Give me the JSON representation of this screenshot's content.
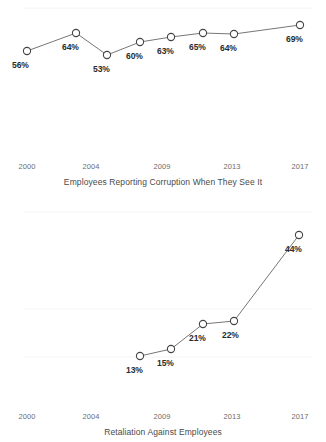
{
  "chart_data": [
    {
      "type": "line",
      "title": "Employees Reporting Corruption When They See It",
      "xlabel": "",
      "ylabel": "",
      "grid": true,
      "legend": "none",
      "x_ticks": [
        "2000",
        "2004",
        "2009",
        "2013",
        "2017"
      ],
      "x_tick_positions": [
        27,
        91,
        162,
        232,
        300
      ],
      "categories": [
        2000,
        2004,
        2006,
        2009,
        2011,
        2013,
        2015,
        2017
      ],
      "values": [
        56,
        64,
        53,
        60,
        63,
        65,
        64,
        69
      ],
      "point_labels": [
        "56%",
        "64%",
        "53%",
        "60%",
        "63%",
        "65%",
        "64%",
        "69%"
      ],
      "points": [
        {
          "label": "56%",
          "value": 56,
          "cx": 27,
          "cy": 51,
          "lx": 12,
          "ly": 60
        },
        {
          "label": "64%",
          "value": 64,
          "cx": 76,
          "cy": 33,
          "lx": 62,
          "ly": 42
        },
        {
          "label": "53%",
          "value": 53,
          "cx": 107,
          "cy": 55,
          "lx": 93,
          "ly": 64
        },
        {
          "label": "60%",
          "value": 60,
          "cx": 140,
          "cy": 42,
          "lx": 126,
          "ly": 51
        },
        {
          "label": "63%",
          "value": 63,
          "cx": 171,
          "cy": 37,
          "lx": 157,
          "ly": 46
        },
        {
          "label": "65%",
          "value": 65,
          "cx": 203,
          "cy": 33,
          "lx": 189,
          "ly": 42
        },
        {
          "label": "64%",
          "value": 64,
          "cx": 234,
          "cy": 34,
          "lx": 220,
          "ly": 43
        },
        {
          "label": "69%",
          "value": 69,
          "cx": 300,
          "cy": 25,
          "lx": 286,
          "ly": 34
        }
      ],
      "gridlines_y": [
        8
      ]
    },
    {
      "type": "line",
      "title": "Retaliation Against Employees",
      "xlabel": "",
      "ylabel": "",
      "grid": true,
      "legend": "none",
      "x_ticks": [
        "2000",
        "2004",
        "2009",
        "2013",
        "2017"
      ],
      "x_tick_positions": [
        27,
        91,
        162,
        232,
        300
      ],
      "categories": [
        2009,
        2011,
        2013,
        2015,
        2017
      ],
      "values": [
        13,
        15,
        21,
        22,
        44
      ],
      "point_labels": [
        "13%",
        "15%",
        "21%",
        "22%",
        "44%"
      ],
      "points": [
        {
          "label": "13%",
          "value": 13,
          "cx": 140,
          "cy": 166,
          "lx": 126,
          "ly": 175
        },
        {
          "label": "15%",
          "value": 15,
          "cx": 171,
          "cy": 159,
          "lx": 157,
          "ly": 168
        },
        {
          "label": "21%",
          "value": 21,
          "cx": 203,
          "cy": 134,
          "lx": 189,
          "ly": 143
        },
        {
          "label": "22%",
          "value": 22,
          "cx": 234,
          "cy": 131,
          "lx": 222,
          "ly": 140
        },
        {
          "label": "44%",
          "value": 44,
          "cx": 299,
          "cy": 45,
          "lx": 285,
          "ly": 54
        }
      ],
      "gridlines_y": [
        22,
        119,
        167
      ]
    }
  ],
  "colors": {
    "line": "#666666",
    "marker_stroke": "#444444",
    "marker_fill": "#ffffff",
    "grid": "#f1f1f1",
    "label_text": "#2b2b2b",
    "tick_text": "#6d6d6d",
    "title_text": "#4a4a4a",
    "background": "#ffffff"
  }
}
